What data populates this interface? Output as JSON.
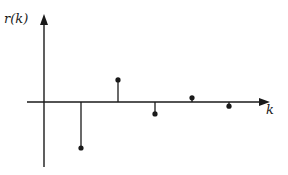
{
  "chart_data": {
    "type": "stem",
    "title": "",
    "xlabel": "k",
    "ylabel": "r(k)",
    "x": [
      1,
      2,
      3,
      4,
      5
    ],
    "values": [
      -1.0,
      0.48,
      -0.26,
      0.09,
      -0.09
    ],
    "grid": false,
    "legend": null,
    "axes": {
      "x_arrow": true,
      "y_arrow": true,
      "ticks": false
    },
    "color": "#1a1a1a"
  },
  "labels": {
    "y_axis": "r(k)",
    "x_axis": "k"
  },
  "layout": {
    "origin_x": 44,
    "origin_y": 102,
    "x_axis_start": 27,
    "x_axis_end": 270,
    "y_axis_top": 14,
    "y_axis_bottom": 167,
    "k_spacing": 37,
    "unit_px": 46
  }
}
